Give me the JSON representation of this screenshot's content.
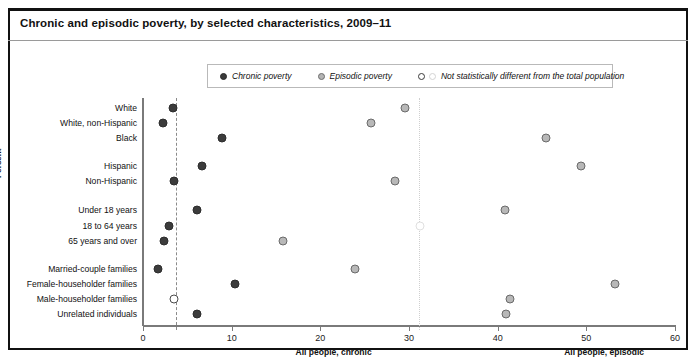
{
  "title": "Chronic and episodic poverty, by selected characteristics, 2009–11",
  "legend": {
    "items": [
      {
        "label": "Chronic poverty",
        "marker": "filled-dark-circle-icon"
      },
      {
        "label": "Episodic poverty",
        "marker": "filled-gray-circle-icon"
      },
      {
        "label": "Not statistically different from the total population",
        "marker": "open-circle-icon"
      }
    ]
  },
  "axes": {
    "ylabel": "Percent",
    "xticks": [
      "0",
      "10",
      "20",
      "30",
      "40",
      "50",
      "60"
    ],
    "xlim": [
      0,
      60
    ],
    "notes": [
      {
        "label": "All people, chronic",
        "value": 3.7
      },
      {
        "label": "All people, episodic",
        "value": 31.1
      }
    ]
  },
  "chart_data": {
    "type": "scatter",
    "title": "Chronic and episodic poverty, by selected characteristics, 2009–11",
    "xlabel": "",
    "ylabel": "Percent",
    "xlim": [
      0,
      60
    ],
    "xticks": [
      0,
      10,
      20,
      30,
      40,
      50,
      60
    ],
    "grid": false,
    "legend_position": "top-center",
    "reference_lines": [
      {
        "name": "All people, chronic",
        "value": 3.7,
        "style": "dashed",
        "color": "#8a8a8a"
      },
      {
        "name": "All people, episodic",
        "value": 31.1,
        "style": "dotted",
        "color": "#cfcfcf"
      }
    ],
    "categories": [
      "White",
      "White, non-Hispanic",
      "Black",
      "Hispanic",
      "Non-Hispanic",
      "Under 18 years",
      "18 to 64 years",
      "65 years and over",
      "Married-couple families",
      "Female-householder families",
      "Male-householder families",
      "Unrelated individuals"
    ],
    "series": [
      {
        "name": "Chronic poverty",
        "values": [
          3.4,
          2.3,
          8.9,
          6.6,
          3.5,
          6.1,
          2.9,
          2.4,
          1.7,
          10.4,
          3.5,
          6.1
        ],
        "not_significant": [
          false,
          false,
          false,
          false,
          false,
          false,
          false,
          false,
          false,
          false,
          true,
          false
        ]
      },
      {
        "name": "Episodic poverty",
        "values": [
          29.6,
          25.7,
          45.4,
          49.4,
          28.4,
          40.8,
          31.2,
          15.8,
          23.9,
          53.2,
          41.4,
          40.9
        ],
        "not_significant": [
          false,
          false,
          false,
          false,
          false,
          false,
          true,
          false,
          false,
          false,
          false,
          false
        ]
      }
    ]
  },
  "rows": [
    {
      "label": "White",
      "y": 108,
      "chronic": 3.4,
      "episodic": 29.6,
      "chronic_ns": false,
      "episodic_ns": false
    },
    {
      "label": "White, non-Hispanic",
      "y": 123,
      "chronic": 2.3,
      "episodic": 25.7,
      "chronic_ns": false,
      "episodic_ns": false
    },
    {
      "label": "Black",
      "y": 138,
      "chronic": 8.9,
      "episodic": 45.4,
      "chronic_ns": false,
      "episodic_ns": false
    },
    {
      "label": "Hispanic",
      "y": 166,
      "chronic": 6.6,
      "episodic": 49.4,
      "chronic_ns": false,
      "episodic_ns": false
    },
    {
      "label": "Non-Hispanic",
      "y": 181,
      "chronic": 3.5,
      "episodic": 28.4,
      "chronic_ns": false,
      "episodic_ns": false
    },
    {
      "label": "Under 18 years",
      "y": 210,
      "chronic": 6.1,
      "episodic": 40.8,
      "chronic_ns": false,
      "episodic_ns": false
    },
    {
      "label": "18 to 64 years",
      "y": 226,
      "chronic": 2.9,
      "episodic": 31.2,
      "chronic_ns": false,
      "episodic_ns": true
    },
    {
      "label": "65 years and over",
      "y": 241,
      "chronic": 2.4,
      "episodic": 15.8,
      "chronic_ns": false,
      "episodic_ns": false
    },
    {
      "label": "Married-couple families",
      "y": 269,
      "chronic": 1.7,
      "episodic": 23.9,
      "chronic_ns": false,
      "episodic_ns": false
    },
    {
      "label": "Female-householder families",
      "y": 284,
      "chronic": 10.4,
      "episodic": 53.2,
      "chronic_ns": false,
      "episodic_ns": false
    },
    {
      "label": "Male-householder families",
      "y": 299,
      "chronic": 3.5,
      "episodic": 41.4,
      "chronic_ns": true,
      "episodic_ns": false
    },
    {
      "label": "Unrelated individuals",
      "y": 314,
      "chronic": 6.1,
      "episodic": 40.9,
      "chronic_ns": false,
      "episodic_ns": false
    }
  ]
}
